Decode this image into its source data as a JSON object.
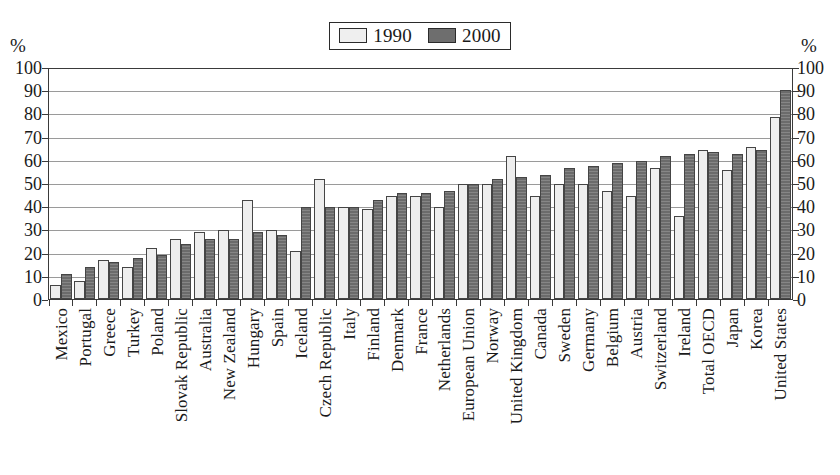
{
  "chart_data": {
    "type": "bar",
    "title": "",
    "subtitle": "",
    "xlabel": "",
    "ylabel": "%",
    "ylabel_right": "%",
    "ylim": [
      0,
      100
    ],
    "yticks": [
      0,
      10,
      20,
      30,
      40,
      50,
      60,
      70,
      80,
      90,
      100
    ],
    "grid": true,
    "legend_position": "top-center",
    "colors": {
      "1990": "#eeeeee",
      "2000": "#6b6b6b",
      "axis": "#3a3a3a",
      "grid": "#9a9a9a"
    },
    "categories": [
      "Mexico",
      "Portugal",
      "Greece",
      "Turkey",
      "Poland",
      "Slovak Republic",
      "Australia",
      "New Zealand",
      "Hungary",
      "Spain",
      "Iceland",
      "Czech Republic",
      "Italy",
      "Finland",
      "Denmark",
      "France",
      "Netherlands",
      "European Union",
      "Norway",
      "United Kingdom",
      "Canada",
      "Sweden",
      "Germany",
      "Belgium",
      "Austria",
      "Switzerland",
      "Ireland",
      "Total OECD",
      "Japan",
      "Korea",
      "United States"
    ],
    "series": [
      {
        "name": "1990",
        "values": [
          6,
          8,
          17,
          14,
          22,
          26,
          29,
          30,
          43,
          30,
          21,
          52,
          40,
          39,
          45,
          45,
          40,
          50,
          50,
          62,
          45,
          50,
          50,
          47,
          45,
          57,
          36,
          65,
          56,
          66,
          79
        ]
      },
      {
        "name": "2000",
        "values": [
          11,
          14,
          16,
          18,
          19,
          24,
          26,
          26,
          29,
          28,
          40,
          40,
          40,
          43,
          46,
          46,
          47,
          50,
          52,
          53,
          54,
          57,
          58,
          59,
          60,
          62,
          63,
          64,
          63,
          65,
          91
        ]
      }
    ],
    "legend": [
      "1990",
      "2000"
    ]
  }
}
